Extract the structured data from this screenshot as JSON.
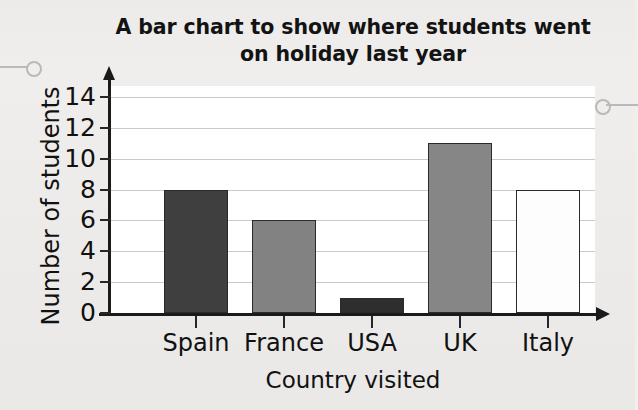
{
  "chart_data": {
    "type": "bar",
    "title": "A bar chart to show where students went on holiday last year",
    "title_lines": [
      "A bar chart to show where students went",
      "on holiday last year"
    ],
    "xlabel": "Country visited",
    "ylabel": "Number of students",
    "categories": [
      "Spain",
      "France",
      "USA",
      "UK",
      "Italy"
    ],
    "values": [
      8,
      6,
      1,
      11,
      8
    ],
    "bar_colors": [
      "#3f3f3f",
      "#828282",
      "#2e2e2e",
      "#868686",
      "#fdfdfd"
    ],
    "bar_border_color": "#2a2a2a",
    "ylim": [
      0,
      14
    ],
    "ytick_labels": [
      "0",
      "2",
      "4",
      "6",
      "8",
      "10",
      "12",
      "14"
    ],
    "ytick_values": [
      0,
      2,
      4,
      6,
      8,
      10,
      12,
      14
    ],
    "grid": true,
    "grid_color": "#c9c9c9",
    "legend": null,
    "plot_background": "#ffffff",
    "page_background": "#efeeec",
    "axis_color": "#1a1a1a"
  },
  "markers": {
    "left_hole_label": "callout-hole-left",
    "right_hole_label": "callout-hole-right"
  }
}
